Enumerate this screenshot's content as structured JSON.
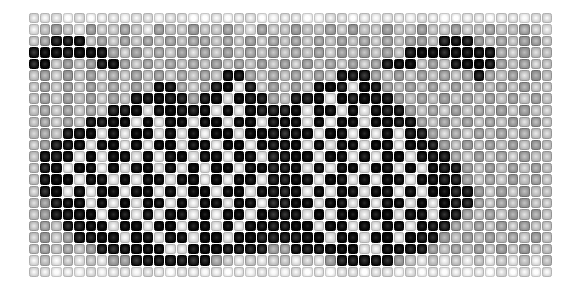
{
  "figure": {
    "kind": "grayscale-cell-mosaic",
    "background_color": "#ffffff",
    "grid": {
      "columns": 46,
      "rows": 23,
      "cell_size_px": 11.5,
      "origin_x_px": 28,
      "origin_y_px": 12,
      "width_px": 525,
      "height_px": 266
    },
    "cell_style": {
      "shape": "rounded-square",
      "corner_radius_px": 2.2,
      "fill": "radial-gradient-bright-center",
      "outline": "darker-than-fill",
      "gap_px": 1
    },
    "palette": {
      "darkest": "#0a0a0a",
      "dark": "#2b2b2b",
      "mid_dark": "#555555",
      "mid": "#808080",
      "mid_light": "#a8a8a8",
      "light": "#d0d0d0",
      "lightest": "#f2f2f2"
    }
  },
  "chart_data": {
    "type": "heatmap",
    "title": "",
    "subtitle": "",
    "xlabel": "",
    "ylabel": "",
    "legend": [],
    "grid": true,
    "colormap": "grayscale",
    "value_range": [
      0,
      9
    ],
    "note": "Value 0 = darkest cell, 9 = lightest cell. Rows top to bottom, columns left to right. Pattern is an approximately left-right mirror-symmetric dark motif resembling a moth or butterfly silhouette on a light field.",
    "columns": 46,
    "rows": 23,
    "values": [
      [
        8,
        8,
        8,
        9,
        8,
        9,
        8,
        8,
        9,
        8,
        8,
        9,
        8,
        8,
        9,
        9,
        8,
        9,
        8,
        8,
        9,
        9,
        8,
        8,
        9,
        9,
        8,
        8,
        9,
        8,
        9,
        8,
        8,
        9,
        8,
        8,
        9,
        9,
        8,
        8,
        9,
        8,
        8,
        9,
        8,
        8
      ],
      [
        8,
        7,
        6,
        7,
        8,
        6,
        7,
        7,
        6,
        7,
        8,
        6,
        7,
        7,
        6,
        7,
        7,
        6,
        7,
        8,
        6,
        7,
        7,
        6,
        7,
        7,
        6,
        7,
        6,
        7,
        7,
        6,
        7,
        7,
        6,
        7,
        7,
        6,
        7,
        7,
        6,
        7,
        7,
        6,
        7,
        8
      ],
      [
        7,
        6,
        1,
        1,
        1,
        7,
        6,
        7,
        6,
        7,
        6,
        7,
        6,
        7,
        6,
        6,
        7,
        6,
        7,
        6,
        7,
        6,
        7,
        6,
        7,
        6,
        7,
        6,
        7,
        6,
        7,
        6,
        7,
        6,
        6,
        7,
        1,
        1,
        1,
        6,
        7,
        6,
        7,
        6,
        6,
        7
      ],
      [
        1,
        0,
        0,
        1,
        0,
        0,
        1,
        6,
        7,
        6,
        7,
        6,
        7,
        6,
        7,
        6,
        7,
        6,
        7,
        6,
        7,
        6,
        7,
        6,
        7,
        6,
        7,
        6,
        7,
        6,
        7,
        6,
        7,
        1,
        0,
        0,
        1,
        0,
        0,
        0,
        1,
        6,
        7,
        6,
        7,
        7
      ],
      [
        1,
        0,
        7,
        6,
        7,
        6,
        1,
        0,
        6,
        7,
        6,
        7,
        6,
        7,
        6,
        7,
        6,
        7,
        6,
        7,
        6,
        7,
        6,
        7,
        6,
        7,
        6,
        7,
        6,
        7,
        6,
        1,
        0,
        0,
        7,
        6,
        7,
        1,
        0,
        0,
        1,
        6,
        7,
        6,
        7,
        7
      ],
      [
        7,
        6,
        7,
        6,
        7,
        6,
        7,
        6,
        7,
        6,
        7,
        6,
        7,
        6,
        7,
        6,
        7,
        1,
        1,
        6,
        7,
        6,
        7,
        6,
        7,
        6,
        7,
        1,
        1,
        1,
        6,
        7,
        6,
        7,
        6,
        7,
        6,
        7,
        6,
        1,
        6,
        7,
        6,
        7,
        6,
        7
      ],
      [
        7,
        6,
        7,
        6,
        7,
        6,
        7,
        6,
        7,
        6,
        7,
        1,
        1,
        6,
        7,
        6,
        1,
        0,
        8,
        1,
        7,
        6,
        7,
        6,
        7,
        1,
        0,
        1,
        8,
        0,
        1,
        6,
        7,
        6,
        7,
        6,
        7,
        6,
        7,
        6,
        7,
        6,
        7,
        6,
        7,
        7
      ],
      [
        7,
        6,
        7,
        6,
        7,
        6,
        7,
        6,
        7,
        1,
        1,
        0,
        1,
        1,
        6,
        1,
        0,
        8,
        0,
        1,
        1,
        6,
        7,
        1,
        1,
        0,
        8,
        0,
        1,
        0,
        1,
        1,
        6,
        7,
        6,
        7,
        6,
        7,
        6,
        7,
        6,
        7,
        6,
        7,
        6,
        7
      ],
      [
        7,
        6,
        7,
        6,
        7,
        6,
        7,
        1,
        1,
        0,
        8,
        0,
        0,
        1,
        1,
        0,
        8,
        0,
        8,
        0,
        1,
        1,
        1,
        0,
        8,
        0,
        0,
        8,
        0,
        8,
        0,
        1,
        1,
        6,
        7,
        6,
        7,
        6,
        7,
        6,
        7,
        6,
        7,
        6,
        7,
        7
      ],
      [
        7,
        6,
        7,
        6,
        7,
        1,
        1,
        0,
        0,
        8,
        0,
        8,
        0,
        0,
        8,
        0,
        0,
        8,
        0,
        0,
        8,
        1,
        0,
        0,
        8,
        0,
        8,
        0,
        0,
        8,
        0,
        0,
        1,
        1,
        6,
        7,
        6,
        7,
        6,
        7,
        6,
        7,
        6,
        7,
        6,
        7
      ],
      [
        7,
        6,
        7,
        1,
        1,
        0,
        8,
        0,
        8,
        0,
        0,
        8,
        0,
        8,
        0,
        8,
        0,
        0,
        8,
        0,
        0,
        1,
        1,
        0,
        0,
        8,
        0,
        0,
        8,
        0,
        8,
        0,
        8,
        1,
        1,
        6,
        7,
        6,
        7,
        6,
        7,
        6,
        7,
        6,
        7,
        7
      ],
      [
        7,
        6,
        1,
        1,
        0,
        8,
        0,
        0,
        8,
        0,
        8,
        0,
        0,
        8,
        0,
        0,
        8,
        0,
        0,
        8,
        0,
        1,
        1,
        0,
        8,
        0,
        8,
        0,
        0,
        8,
        0,
        0,
        8,
        0,
        1,
        1,
        6,
        7,
        6,
        7,
        6,
        7,
        6,
        7,
        6,
        7
      ],
      [
        7,
        1,
        1,
        0,
        8,
        0,
        8,
        0,
        0,
        8,
        0,
        8,
        0,
        0,
        8,
        0,
        0,
        8,
        0,
        0,
        8,
        1,
        1,
        0,
        0,
        8,
        0,
        0,
        8,
        0,
        8,
        0,
        0,
        8,
        0,
        1,
        1,
        6,
        7,
        6,
        7,
        6,
        7,
        6,
        7,
        7
      ],
      [
        7,
        1,
        0,
        8,
        0,
        0,
        8,
        0,
        8,
        0,
        0,
        8,
        0,
        8,
        0,
        8,
        0,
        0,
        8,
        0,
        0,
        1,
        1,
        0,
        8,
        0,
        8,
        0,
        0,
        8,
        0,
        0,
        8,
        0,
        8,
        0,
        1,
        1,
        6,
        7,
        6,
        7,
        6,
        7,
        6,
        7
      ],
      [
        7,
        1,
        0,
        0,
        8,
        0,
        0,
        8,
        0,
        8,
        0,
        0,
        8,
        0,
        0,
        8,
        0,
        8,
        0,
        0,
        8,
        1,
        1,
        0,
        0,
        8,
        0,
        0,
        8,
        0,
        8,
        0,
        0,
        8,
        0,
        0,
        1,
        1,
        6,
        7,
        6,
        7,
        6,
        7,
        6,
        7
      ],
      [
        7,
        1,
        0,
        8,
        0,
        8,
        0,
        0,
        8,
        0,
        0,
        8,
        0,
        8,
        0,
        0,
        8,
        0,
        0,
        8,
        0,
        1,
        1,
        0,
        8,
        0,
        8,
        0,
        0,
        8,
        0,
        0,
        8,
        0,
        8,
        0,
        0,
        1,
        1,
        6,
        7,
        6,
        7,
        6,
        7
      ],
      [
        7,
        6,
        1,
        0,
        0,
        8,
        0,
        8,
        0,
        8,
        0,
        0,
        8,
        0,
        8,
        0,
        0,
        8,
        0,
        0,
        8,
        1,
        1,
        0,
        0,
        8,
        0,
        0,
        8,
        0,
        8,
        0,
        0,
        8,
        0,
        8,
        0,
        1,
        1,
        6,
        7,
        6,
        7,
        6,
        7
      ],
      [
        7,
        6,
        1,
        1,
        0,
        0,
        8,
        0,
        0,
        8,
        0,
        8,
        0,
        0,
        8,
        0,
        8,
        0,
        0,
        8,
        0,
        1,
        1,
        0,
        8,
        0,
        8,
        0,
        0,
        8,
        0,
        0,
        8,
        0,
        0,
        8,
        1,
        1,
        6,
        7,
        6,
        7,
        6,
        7,
        6,
        7
      ],
      [
        7,
        6,
        7,
        1,
        1,
        0,
        0,
        8,
        0,
        0,
        8,
        0,
        0,
        8,
        0,
        0,
        8,
        0,
        8,
        0,
        0,
        1,
        1,
        0,
        0,
        8,
        0,
        0,
        8,
        0,
        8,
        0,
        0,
        8,
        0,
        1,
        1,
        6,
        7,
        6,
        7,
        6,
        7,
        6,
        7,
        7
      ],
      [
        7,
        6,
        7,
        6,
        1,
        1,
        0,
        0,
        8,
        0,
        0,
        8,
        0,
        0,
        8,
        0,
        0,
        8,
        0,
        0,
        1,
        1,
        1,
        1,
        0,
        0,
        8,
        0,
        0,
        8,
        0,
        0,
        8,
        0,
        1,
        1,
        6,
        7,
        6,
        7,
        6,
        7,
        6,
        7,
        6,
        7
      ],
      [
        7,
        6,
        7,
        6,
        7,
        6,
        1,
        1,
        1,
        0,
        0,
        0,
        8,
        8,
        0,
        0,
        0,
        1,
        1,
        1,
        1,
        6,
        6,
        1,
        1,
        1,
        0,
        0,
        0,
        8,
        8,
        0,
        0,
        1,
        1,
        6,
        7,
        6,
        7,
        6,
        7,
        6,
        7,
        6,
        7
      ],
      [
        8,
        7,
        8,
        7,
        8,
        7,
        8,
        6,
        6,
        1,
        1,
        1,
        1,
        1,
        1,
        1,
        6,
        7,
        8,
        7,
        8,
        7,
        7,
        8,
        7,
        8,
        6,
        1,
        1,
        1,
        1,
        1,
        6,
        7,
        8,
        7,
        8,
        7,
        8,
        7,
        8,
        7,
        8,
        7,
        8,
        7
      ],
      [
        8,
        8,
        9,
        8,
        9,
        8,
        9,
        8,
        8,
        9,
        8,
        8,
        9,
        8,
        8,
        9,
        8,
        9,
        8,
        9,
        8,
        9,
        9,
        8,
        9,
        8,
        9,
        8,
        8,
        9,
        8,
        8,
        9,
        8,
        9,
        8,
        9,
        8,
        9,
        8,
        9,
        8,
        9,
        8,
        9,
        8
      ]
    ]
  }
}
